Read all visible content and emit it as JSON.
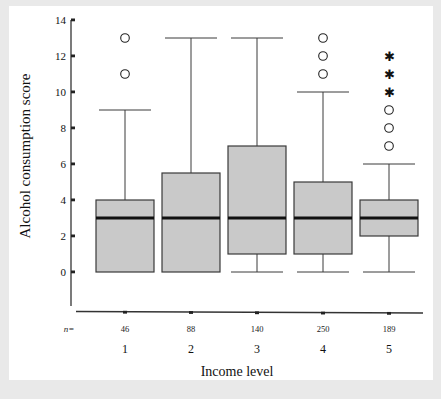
{
  "chart_data": {
    "type": "box",
    "title": "",
    "xlabel": "Income level",
    "ylabel": "Alcohol consumption score",
    "ylim": [
      0,
      14
    ],
    "yticks": [
      0,
      2,
      4,
      6,
      8,
      10,
      12,
      14
    ],
    "grid": false,
    "legend": "none",
    "categories": [
      "1",
      "2",
      "3",
      "4",
      "5"
    ],
    "n_label": "n=",
    "n_counts": [
      "46",
      "88",
      "140",
      "250",
      "189"
    ],
    "boxes": [
      {
        "category": "1",
        "n": 46,
        "whisker_low": 0,
        "q1": 0,
        "median": 3,
        "q3": 4,
        "whisker_high": 9,
        "outliers": [
          11,
          13
        ],
        "extremes": []
      },
      {
        "category": "2",
        "n": 88,
        "whisker_low": 0,
        "q1": 0,
        "median": 3,
        "q3": 5.5,
        "whisker_high": 13,
        "outliers": [],
        "extremes": []
      },
      {
        "category": "3",
        "n": 140,
        "whisker_low": 0,
        "q1": 1,
        "median": 3,
        "q3": 7,
        "whisker_high": 13,
        "outliers": [],
        "extremes": []
      },
      {
        "category": "4",
        "n": 250,
        "whisker_low": 0,
        "q1": 1,
        "median": 3,
        "q3": 5,
        "whisker_high": 10,
        "outliers": [
          11,
          12,
          13
        ],
        "extremes": []
      },
      {
        "category": "5",
        "n": 189,
        "whisker_low": 0,
        "q1": 2,
        "median": 3,
        "q3": 4,
        "whisker_high": 6,
        "outliers": [
          7,
          8,
          9
        ],
        "extremes": [
          10,
          11,
          12
        ]
      }
    ]
  },
  "style": {
    "box_fill": "#c9c9c9",
    "box_stroke": "#3a3a3a",
    "median_color": "#111111",
    "axis_color": "#333333",
    "page_background": "#e9e9e9",
    "figure_background": "#ffffff"
  },
  "glyphs": {
    "outlier": "circle-marker",
    "extreme": "asterisk-marker"
  }
}
